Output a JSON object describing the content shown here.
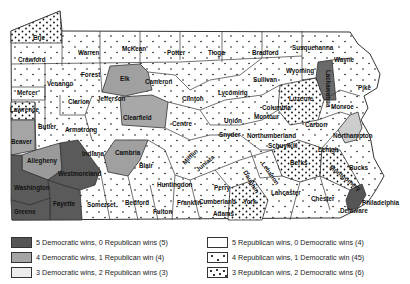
{
  "map": {
    "colors": {
      "dem5": "#555555",
      "dem4": "#a9a9a9",
      "dem3": "#ececec",
      "rep5": "#ffffff",
      "rep4": "#ffffff",
      "rep3": "#ffffff",
      "border": "#333333",
      "dot": "#111111"
    },
    "counties": [
      {
        "name": "Erie",
        "category": "rep3",
        "x": 33,
        "y": 34
      },
      {
        "name": "Warren",
        "category": "rep4",
        "x": 78,
        "y": 49
      },
      {
        "name": "McKean",
        "category": "rep4",
        "x": 122,
        "y": 45
      },
      {
        "name": "Potter",
        "category": "rep4",
        "x": 167,
        "y": 49
      },
      {
        "name": "Tioga",
        "category": "rep4",
        "x": 208,
        "y": 49
      },
      {
        "name": "Bradford",
        "category": "rep4",
        "x": 252,
        "y": 49
      },
      {
        "name": "Susquehanna",
        "category": "rep4",
        "x": 292,
        "y": 44
      },
      {
        "name": "Wayne",
        "category": "rep4",
        "x": 334,
        "y": 56
      },
      {
        "name": "Crawford",
        "category": "rep4",
        "x": 18,
        "y": 56
      },
      {
        "name": "Forest",
        "category": "rep4",
        "x": 81,
        "y": 71
      },
      {
        "name": "Elk",
        "category": "dem4",
        "x": 120,
        "y": 75
      },
      {
        "name": "Cameron",
        "category": "rep4",
        "x": 145,
        "y": 78
      },
      {
        "name": "Wyoming",
        "category": "rep4",
        "x": 286,
        "y": 67
      },
      {
        "name": "Lackawanna",
        "category": "dem5",
        "x": 326,
        "y": 64
      },
      {
        "name": "Pike",
        "category": "rep4",
        "x": 358,
        "y": 84
      },
      {
        "name": "Sullivan",
        "category": "rep4",
        "x": 253,
        "y": 76
      },
      {
        "name": "Venango",
        "category": "rep4",
        "x": 47,
        "y": 80
      },
      {
        "name": "Mercer",
        "category": "rep4",
        "x": 17,
        "y": 89
      },
      {
        "name": "Clarion",
        "category": "rep4",
        "x": 68,
        "y": 98
      },
      {
        "name": "Jefferson",
        "category": "rep4",
        "x": 97,
        "y": 95
      },
      {
        "name": "Clinton",
        "category": "rep4",
        "x": 182,
        "y": 95
      },
      {
        "name": "Lycoming",
        "category": "rep4",
        "x": 218,
        "y": 89
      },
      {
        "name": "Luzerne",
        "category": "rep3",
        "x": 289,
        "y": 95
      },
      {
        "name": "Monroe",
        "category": "rep4",
        "x": 331,
        "y": 103
      },
      {
        "name": "Lawrence",
        "category": "rep3",
        "x": 10,
        "y": 106
      },
      {
        "name": "Butler",
        "category": "rep4",
        "x": 38,
        "y": 123
      },
      {
        "name": "Clearfield",
        "category": "dem4",
        "x": 123,
        "y": 114
      },
      {
        "name": "Centre",
        "category": "rep4",
        "x": 172,
        "y": 120
      },
      {
        "name": "Columbia",
        "category": "rep4",
        "x": 262,
        "y": 104
      },
      {
        "name": "Montour",
        "category": "rep4",
        "x": 254,
        "y": 113
      },
      {
        "name": "Carbon",
        "category": "rep4",
        "x": 305,
        "y": 121
      },
      {
        "name": "Northampton",
        "category": "dem3",
        "x": 333,
        "y": 132
      },
      {
        "name": "Armstrong",
        "category": "rep4",
        "x": 65,
        "y": 126
      },
      {
        "name": "Beaver",
        "category": "dem3",
        "x": 11,
        "y": 138
      },
      {
        "name": "Union",
        "category": "rep4",
        "x": 224,
        "y": 117
      },
      {
        "name": "Snyder",
        "category": "rep4",
        "x": 219,
        "y": 131
      },
      {
        "name": "Northumberland",
        "category": "rep4",
        "x": 247,
        "y": 132
      },
      {
        "name": "Allegheny",
        "category": "dem4",
        "x": 27,
        "y": 157
      },
      {
        "name": "Indiana",
        "category": "rep4",
        "x": 82,
        "y": 150
      },
      {
        "name": "Cambria",
        "category": "dem4",
        "x": 115,
        "y": 149
      },
      {
        "name": "Mifflin",
        "category": "rep4",
        "x": 185,
        "y": 159
      },
      {
        "name": "Juniata",
        "category": "rep4",
        "x": 198,
        "y": 166
      },
      {
        "name": "Schuylkill",
        "category": "rep4",
        "x": 268,
        "y": 142
      },
      {
        "name": "Lehigh",
        "category": "rep4",
        "x": 318,
        "y": 146
      },
      {
        "name": "Blair",
        "category": "rep4",
        "x": 139,
        "y": 162
      },
      {
        "name": "Berks",
        "category": "rep3",
        "x": 290,
        "y": 159
      },
      {
        "name": "Bucks",
        "category": "rep4",
        "x": 349,
        "y": 164
      },
      {
        "name": "Westmoreland",
        "category": "dem5",
        "x": 58,
        "y": 170
      },
      {
        "name": "Perry",
        "category": "rep4",
        "x": 214,
        "y": 184
      },
      {
        "name": "Dauphin",
        "category": "rep4",
        "x": 243,
        "y": 166
      },
      {
        "name": "Lebanon",
        "category": "rep4",
        "x": 261,
        "y": 158
      },
      {
        "name": "Montgomery",
        "category": "rep3",
        "x": 329,
        "y": 162
      },
      {
        "name": "Washington",
        "category": "dem5",
        "x": 14,
        "y": 184
      },
      {
        "name": "Huntingdon",
        "category": "rep4",
        "x": 157,
        "y": 181
      },
      {
        "name": "Cumberland",
        "category": "rep4",
        "x": 199,
        "y": 198
      },
      {
        "name": "Lancaster",
        "category": "rep4",
        "x": 271,
        "y": 189
      },
      {
        "name": "Chester",
        "category": "rep4",
        "x": 311,
        "y": 195
      },
      {
        "name": "Philadelphia",
        "category": "dem5",
        "x": 362,
        "y": 199
      },
      {
        "name": "Fayette",
        "category": "dem5",
        "x": 53,
        "y": 200
      },
      {
        "name": "Somerset",
        "category": "rep4",
        "x": 87,
        "y": 201
      },
      {
        "name": "Bedford",
        "category": "rep4",
        "x": 125,
        "y": 199
      },
      {
        "name": "Fulton",
        "category": "rep4",
        "x": 153,
        "y": 208
      },
      {
        "name": "Franklin",
        "category": "rep4",
        "x": 177,
        "y": 199
      },
      {
        "name": "Adams",
        "category": "rep4",
        "x": 213,
        "y": 210
      },
      {
        "name": "York",
        "category": "rep3",
        "x": 243,
        "y": 198
      },
      {
        "name": "Delaware",
        "category": "rep4",
        "x": 340,
        "y": 207
      },
      {
        "name": "Greene",
        "category": "dem5",
        "x": 14,
        "y": 208
      }
    ]
  },
  "legend": {
    "items": [
      {
        "label": "5 Democratic wins, 0 Republican wins (5)",
        "category": "dem5"
      },
      {
        "label": "4 Democratic wins, 1 Republican win (4)",
        "category": "dem4"
      },
      {
        "label": "3 Democratic wins, 2 Republican wins (3)",
        "category": "dem3"
      },
      {
        "label": "5 Republican wins, 0 Democratic wins (4)",
        "category": "rep5"
      },
      {
        "label": "4 Republican wins, 1 Democratic win (45)",
        "category": "rep4"
      },
      {
        "label": "3 Republican wins, 2 Democratic wins (6)",
        "category": "rep3"
      }
    ]
  }
}
